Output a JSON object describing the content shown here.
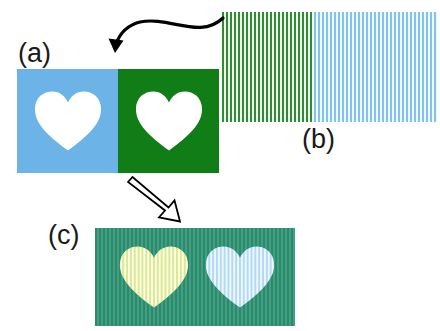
{
  "figure": {
    "background_color": "#ffffff",
    "width": 440,
    "height": 331
  },
  "labels": {
    "a": "(a)",
    "b": "(b)",
    "c": "(c)"
  },
  "panel_a": {
    "name": "source stimulus panel",
    "left_square": {
      "background_color": "#6cb4e8",
      "shape": "heart",
      "shape_color": "#ffffff"
    },
    "right_square": {
      "background_color": "#117d16",
      "shape": "heart",
      "shape_color": "#ffffff"
    }
  },
  "panel_b": {
    "name": "stripe pattern panel",
    "left_half": {
      "stripe_color": "#2f8c36",
      "gap_color": "#f4f7ee",
      "stripe_period_px": 4
    },
    "right_half": {
      "stripe_color": "#7fc4ee",
      "gap_color": "#f2f8fc",
      "stripe_period_px": 4
    }
  },
  "panel_c": {
    "name": "combined result panel",
    "background": {
      "stripe_color_1": "#2f8c5a",
      "stripe_color_2": "#3f9e93",
      "stripe_period_px": 4
    },
    "left_heart": {
      "stripe_color": "#e9f2a8",
      "gap_color": "#fbfde8"
    },
    "right_heart": {
      "stripe_color": "#bfe0f5",
      "gap_color": "#eef7fd"
    }
  },
  "arrows": {
    "curved": {
      "name": "curved-arrow-b-to-a",
      "from": "(b)",
      "to": "(a)",
      "style": "solid filled black curve",
      "color": "#000000"
    },
    "hollow": {
      "name": "hollow-arrow-a-to-c",
      "from": "(a)",
      "to": "(c)",
      "style": "outline block arrow",
      "color": "#000000"
    }
  }
}
